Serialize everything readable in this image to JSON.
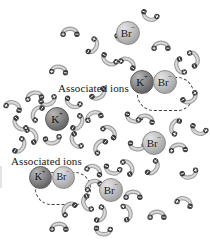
{
  "figure": {
    "name": "ion-association-in-aqueous-solution",
    "background_color": "#ffffff",
    "width": 210,
    "height": 240
  },
  "labels": [
    {
      "id": "assoc-top",
      "text": "Associated ions",
      "x": 58,
      "y": 82
    },
    {
      "id": "assoc-bottom",
      "text": "Associated ions",
      "x": 11,
      "y": 155
    }
  ],
  "symbols": {
    "potassium": "K",
    "potassium_charge": "+",
    "bromide": "Br",
    "bromide_charge": "−",
    "dipole_positive": "+",
    "dipole_negative": "−"
  },
  "colors": {
    "cation_fill": "#6d6d6d",
    "anion_fill": "#b5b5b5",
    "outline": "#3b3b3b",
    "text": "#151515",
    "background": "#ffffff"
  },
  "ions": [
    {
      "id": "br-free-top",
      "species": "Br",
      "charge": "−",
      "x": 128,
      "y": 33,
      "d": 24,
      "font": 11,
      "solvated": true
    },
    {
      "id": "k-pair-top",
      "species": "K",
      "charge": "+",
      "x": 142,
      "y": 82,
      "d": 24,
      "font": 11,
      "solvated": false
    },
    {
      "id": "br-pair-top",
      "species": "Br",
      "charge": "−",
      "x": 165,
      "y": 82,
      "d": 24,
      "font": 11,
      "solvated": false
    },
    {
      "id": "k-free-middle",
      "species": "K",
      "charge": "+",
      "x": 57,
      "y": 119,
      "d": 24,
      "font": 11,
      "solvated": true
    },
    {
      "id": "br-free-right",
      "species": "Br",
      "charge": "−",
      "x": 154,
      "y": 143,
      "d": 24,
      "font": 11,
      "solvated": true
    },
    {
      "id": "k-pair-bottom",
      "species": "K",
      "charge": "+",
      "x": 40,
      "y": 177,
      "d": 23,
      "font": 10,
      "solvated": false
    },
    {
      "id": "br-pair-bottom",
      "species": "Br",
      "charge": "−",
      "x": 63,
      "y": 177,
      "d": 23,
      "font": 10,
      "solvated": false
    },
    {
      "id": "br-free-bottom",
      "species": "Br",
      "charge": "−",
      "x": 111,
      "y": 190,
      "d": 24,
      "font": 11,
      "solvated": true
    }
  ],
  "association_boxes": [
    {
      "id": "assoc-box-top",
      "x": 137,
      "y": 77,
      "w": 57,
      "h": 34
    },
    {
      "id": "assoc-box-bottom",
      "x": 35,
      "y": 172,
      "w": 56,
      "h": 33
    }
  ],
  "water_molecules": [
    {
      "x": 70,
      "y": 30,
      "r": 0
    },
    {
      "x": 95,
      "y": 47,
      "r": 115
    },
    {
      "x": 59,
      "y": 68,
      "r": 5
    },
    {
      "x": 149,
      "y": 18,
      "r": 200
    },
    {
      "x": 124,
      "y": 40,
      "r": 180
    },
    {
      "x": 161,
      "y": 44,
      "r": 0
    },
    {
      "x": 129,
      "y": 61,
      "r": 30
    },
    {
      "x": 108,
      "y": 62,
      "r": 210
    },
    {
      "x": 178,
      "y": 67,
      "r": 250
    },
    {
      "x": 196,
      "y": 58,
      "r": 70
    },
    {
      "x": 191,
      "y": 100,
      "r": 150
    },
    {
      "x": 34,
      "y": 94,
      "r": 350
    },
    {
      "x": 14,
      "y": 104,
      "r": 20
    },
    {
      "x": 49,
      "y": 103,
      "r": 160
    },
    {
      "x": 72,
      "y": 105,
      "r": 205
    },
    {
      "x": 35,
      "y": 112,
      "r": 300
    },
    {
      "x": 80,
      "y": 124,
      "r": 120
    },
    {
      "x": 34,
      "y": 134,
      "r": 60
    },
    {
      "x": 53,
      "y": 142,
      "r": 170
    },
    {
      "x": 74,
      "y": 142,
      "r": 240
    },
    {
      "x": 93,
      "y": 114,
      "r": 340
    },
    {
      "x": 111,
      "y": 130,
      "r": 40
    },
    {
      "x": 133,
      "y": 120,
      "r": 195
    },
    {
      "x": 146,
      "y": 117,
      "r": 10
    },
    {
      "x": 173,
      "y": 126,
      "r": 290
    },
    {
      "x": 137,
      "y": 148,
      "r": 185
    },
    {
      "x": 178,
      "y": 146,
      "r": 355
    },
    {
      "x": 130,
      "y": 166,
      "r": 60
    },
    {
      "x": 155,
      "y": 169,
      "r": 125
    },
    {
      "x": 98,
      "y": 145,
      "r": 305
    },
    {
      "x": 95,
      "y": 168,
      "r": 25
    },
    {
      "x": 92,
      "y": 183,
      "r": 335
    },
    {
      "x": 112,
      "y": 172,
      "r": 195
    },
    {
      "x": 133,
      "y": 193,
      "r": 0
    },
    {
      "x": 129,
      "y": 212,
      "r": 75
    },
    {
      "x": 103,
      "y": 215,
      "r": 110
    },
    {
      "x": 85,
      "y": 204,
      "r": 250
    },
    {
      "x": 67,
      "y": 207,
      "r": 315
    },
    {
      "x": 59,
      "y": 225,
      "r": 0
    },
    {
      "x": 103,
      "y": 233,
      "r": 185
    },
    {
      "x": 157,
      "y": 213,
      "r": 0
    },
    {
      "x": 185,
      "y": 200,
      "r": 20
    },
    {
      "x": 190,
      "y": 176,
      "r": 165
    },
    {
      "x": 22,
      "y": 147,
      "r": 120
    },
    {
      "x": 18,
      "y": 126,
      "r": 225
    },
    {
      "x": 100,
      "y": 96,
      "r": 145
    },
    {
      "x": 198,
      "y": 132,
      "r": 200
    }
  ]
}
